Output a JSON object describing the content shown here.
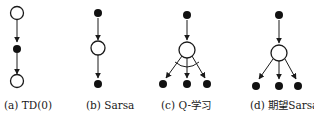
{
  "figure": {
    "panels": [
      {
        "id": "a",
        "label": "(a) TD(0)",
        "title": "TD(0)"
      },
      {
        "id": "b",
        "label": "(b) Sarsa",
        "title": "Sarsa"
      },
      {
        "id": "c",
        "label": "(c) Q-学习",
        "title": "Q-学习"
      },
      {
        "id": "d",
        "label": "(d) 期望Sarsa",
        "title": "期望Sarsa"
      }
    ],
    "colors": {
      "stroke": "#1a1a1a",
      "fill_state": "#ffffff",
      "fill_action": "#111111"
    }
  }
}
